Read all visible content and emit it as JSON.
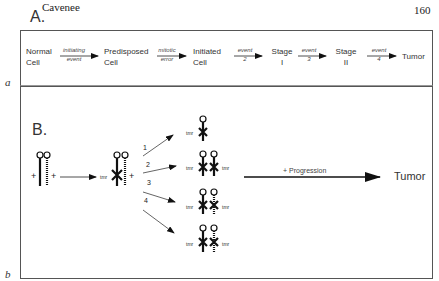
{
  "header": {
    "author": "Cavenee",
    "page_number": "160"
  },
  "panel_a": {
    "label": "A.",
    "letter": "a",
    "stages": [
      {
        "line1": "Normal",
        "line2": "Cell"
      },
      {
        "line1": "Predisposed",
        "line2": "Cell"
      },
      {
        "line1": "Initiated",
        "line2": "Cell"
      },
      {
        "line1": "Stage",
        "line2": "I"
      },
      {
        "line1": "Stage",
        "line2": "II"
      },
      {
        "line1": "Tumor",
        "line2": ""
      }
    ],
    "transitions": [
      {
        "top": "initiating",
        "bottom": "event"
      },
      {
        "top": "mitotic",
        "bottom": "error"
      },
      {
        "top": "event",
        "bottom": "2"
      },
      {
        "top": "event",
        "bottom": "3"
      },
      {
        "top": "event",
        "bottom": "4"
      }
    ]
  },
  "panel_b": {
    "label": "B.",
    "letter": "b",
    "plus": "+",
    "tmr": "tmr",
    "pathways": [
      "1",
      "2",
      "3",
      "4"
    ],
    "progression_label": "+ Progression",
    "outcome": "Tumor"
  }
}
